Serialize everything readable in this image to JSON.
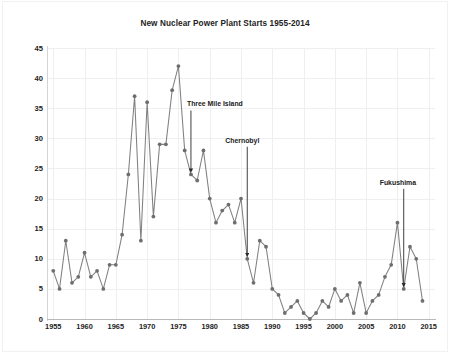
{
  "chart_data": {
    "type": "line",
    "title": "New Nuclear Power Plant Starts 1955-2014",
    "xlabel": "",
    "ylabel": "",
    "xlim": [
      1954,
      2016
    ],
    "ylim": [
      0,
      45
    ],
    "ytick_values": [
      0,
      5,
      10,
      15,
      20,
      25,
      30,
      35,
      40,
      45
    ],
    "ytick_labels": [
      "0",
      "5",
      "10",
      "15",
      "20",
      "25",
      "30",
      "35",
      "40",
      "45"
    ],
    "xtick_values": [
      1955,
      1960,
      1965,
      1970,
      1975,
      1980,
      1985,
      1990,
      1995,
      2000,
      2005,
      2010,
      2015
    ],
    "xtick_labels": [
      "1955",
      "1960",
      "1965",
      "1970",
      "1975",
      "1980",
      "1985",
      "1990",
      "1995",
      "2000",
      "2005",
      "2010",
      "2015"
    ],
    "grid": true,
    "legend": "none",
    "marker": "circle",
    "line_color": "#808080",
    "marker_color": "#6e6e6e",
    "grid_color": "#efefef",
    "x": [
      1955,
      1956,
      1957,
      1958,
      1959,
      1960,
      1961,
      1962,
      1963,
      1964,
      1965,
      1966,
      1967,
      1968,
      1969,
      1970,
      1971,
      1972,
      1973,
      1974,
      1975,
      1976,
      1977,
      1978,
      1979,
      1980,
      1981,
      1982,
      1983,
      1984,
      1985,
      1986,
      1987,
      1988,
      1989,
      1990,
      1991,
      1992,
      1993,
      1994,
      1995,
      1996,
      1997,
      1998,
      1999,
      2000,
      2001,
      2002,
      2003,
      2004,
      2005,
      2006,
      2007,
      2008,
      2009,
      2010,
      2011,
      2012,
      2013,
      2014
    ],
    "values": [
      8,
      5,
      13,
      6,
      7,
      11,
      7,
      8,
      5,
      9,
      9,
      14,
      24,
      37,
      13,
      36,
      17,
      29,
      29,
      38,
      42,
      28,
      24,
      23,
      28,
      20,
      16,
      18,
      19,
      16,
      20,
      10,
      6,
      13,
      12,
      5,
      4,
      1,
      2,
      3,
      1,
      0,
      1,
      3,
      2,
      5,
      3,
      4,
      1,
      6,
      1,
      3,
      4,
      7,
      9,
      16,
      5,
      12,
      10,
      3
    ],
    "annotations": [
      {
        "label": "Three Mile Island",
        "x": 1977,
        "y": 24
      },
      {
        "label": "Chernobyl",
        "x": 1986,
        "y": 10
      },
      {
        "label": "Fukushima",
        "x": 2011,
        "y": 5
      }
    ]
  }
}
